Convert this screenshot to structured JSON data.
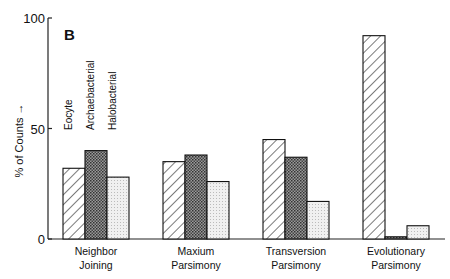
{
  "chart_data": {
    "type": "bar",
    "panel_label": "B",
    "title": "",
    "xlabel": "",
    "ylabel": "% of Counts →",
    "ylim": [
      0,
      100
    ],
    "yticks": [
      0,
      50,
      100
    ],
    "grid": false,
    "legend_position": "top-left, vertical labels above first group",
    "categories": [
      "Neighbor Joining",
      "Maxium Parsimony",
      "Transversion Parsimony",
      "Evolutionary Parsimony"
    ],
    "category_lines": [
      [
        "Neighbor",
        "Joining"
      ],
      [
        "Maxium",
        "Parsimony"
      ],
      [
        "Transversion",
        "Parsimony"
      ],
      [
        "Evolutionary",
        "Parsimony"
      ]
    ],
    "series": [
      {
        "name": "Eocyte",
        "pattern": "diagonal-hatch",
        "values": [
          32,
          35,
          45,
          92
        ]
      },
      {
        "name": "Archaebacterial",
        "pattern": "dark-stipple",
        "values": [
          40,
          38,
          37,
          1
        ]
      },
      {
        "name": "Halobacterial",
        "pattern": "light-stipple",
        "values": [
          28,
          26,
          17,
          6
        ]
      }
    ]
  }
}
